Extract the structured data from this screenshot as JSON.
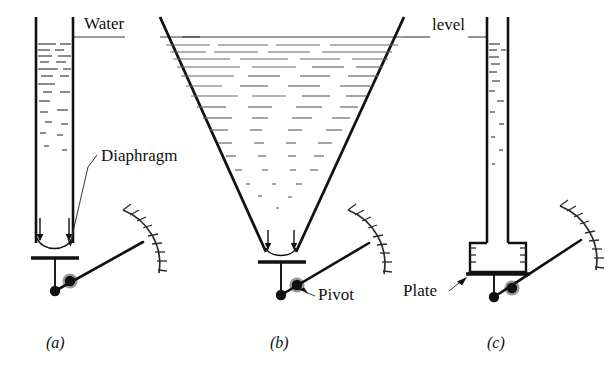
{
  "figure": {
    "kind": "technical-diagram",
    "background_color": "#ffffff",
    "ink_color": "#111111",
    "labels": {
      "water": "Water",
      "level": "level",
      "diaphragm": "Diaphragm",
      "pivot": "Pivot",
      "plate": "Plate"
    },
    "subfigures": [
      {
        "id": "a",
        "caption": "(a)",
        "vessel": "straight-tube",
        "sensor": "diaphragm"
      },
      {
        "id": "b",
        "caption": "(b)",
        "vessel": "cone-funnel",
        "sensor": "diaphragm"
      },
      {
        "id": "c",
        "caption": "(c)",
        "vessel": "narrow-tube-with-chamber",
        "sensor": "plate"
      }
    ],
    "annotations": {
      "water_level_label_parts": [
        "Water",
        "level"
      ],
      "gauge_count": 3,
      "gauge_tick_count": 9
    }
  }
}
